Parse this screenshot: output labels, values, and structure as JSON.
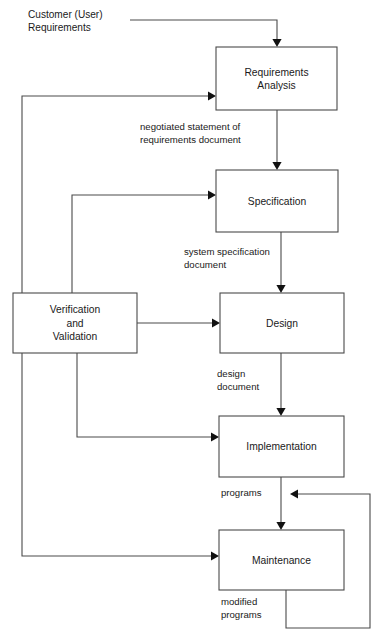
{
  "diagram": {
    "background_color": "#ffffff",
    "line_color": "#4a4a4a",
    "text_color": "#1a1a1a",
    "boxes": [
      {
        "id": "requirements-analysis",
        "lines": [
          "Requirements",
          "Analysis"
        ],
        "x": 216,
        "y": 47,
        "w": 121,
        "h": 63
      },
      {
        "id": "specification",
        "lines": [
          "Specification"
        ],
        "x": 216,
        "y": 170,
        "w": 122,
        "h": 62
      },
      {
        "id": "verification-and-validation",
        "lines": [
          "Verification",
          "and",
          "Validation"
        ],
        "x": 13,
        "y": 293,
        "w": 124,
        "h": 60
      },
      {
        "id": "design",
        "lines": [
          "Design"
        ],
        "x": 220,
        "y": 293,
        "w": 124,
        "h": 60
      },
      {
        "id": "implementation",
        "lines": [
          "Implementation"
        ],
        "x": 219,
        "y": 416,
        "w": 125,
        "h": 61
      },
      {
        "id": "maintenance",
        "lines": [
          "Maintenance"
        ],
        "x": 219,
        "y": 530,
        "w": 125,
        "h": 60
      }
    ],
    "source_label": {
      "id": "customer-user-requirements",
      "lines": [
        "Customer (User)",
        "Requirements"
      ],
      "x": 28,
      "y": 8
    },
    "edge_labels": [
      {
        "id": "negotiated-statement",
        "lines": [
          "negotiated statement of",
          "requirements document"
        ],
        "x": 140,
        "y": 120
      },
      {
        "id": "system-specification-document",
        "lines": [
          "system specification",
          "document"
        ],
        "x": 184,
        "y": 245
      },
      {
        "id": "design-document",
        "lines": [
          "design",
          "document"
        ],
        "x": 217,
        "y": 367
      },
      {
        "id": "programs",
        "lines": [
          "programs"
        ],
        "x": 221,
        "y": 486
      },
      {
        "id": "modified-programs",
        "lines": [
          "modified",
          "programs"
        ],
        "x": 221,
        "y": 595
      }
    ],
    "connectors": [
      {
        "id": "customer-to-requirements-analysis",
        "from": "Customer (User) Requirements",
        "to": "Requirements Analysis",
        "path": "M 130 20 L 277 20 L 277 43",
        "arrow": {
          "x": 277,
          "y": 47,
          "dir": "down"
        }
      },
      {
        "id": "validation-feedback-to-requirements-analysis",
        "from": "Verification and Validation",
        "to": "Requirements Analysis",
        "path": "M 22 293 L 22 96 L 212 96",
        "arrow": {
          "x": 216,
          "y": 96,
          "dir": "right"
        }
      },
      {
        "id": "requirements-analysis-to-specification",
        "from": "Requirements Analysis",
        "to": "Specification",
        "path": "M 277 110 L 277 166",
        "arrow": {
          "x": 277,
          "y": 170,
          "dir": "down"
        }
      },
      {
        "id": "validation-feedback-to-specification",
        "from": "Verification and Validation",
        "to": "Specification",
        "path": "M 72 293 L 72 195 L 212 195",
        "arrow": {
          "x": 216,
          "y": 195,
          "dir": "right"
        }
      },
      {
        "id": "specification-to-design",
        "from": "Specification",
        "to": "Design",
        "path": "M 281 232 L 281 289",
        "arrow": {
          "x": 281,
          "y": 293,
          "dir": "down"
        }
      },
      {
        "id": "validation-to-design",
        "from": "Verification and Validation",
        "to": "Design",
        "path": "M 137 323 L 216 323",
        "arrow": {
          "x": 220,
          "y": 323,
          "dir": "right"
        }
      },
      {
        "id": "design-to-implementation",
        "from": "Design",
        "to": "Implementation",
        "path": "M 281 353 L 281 412",
        "arrow": {
          "x": 281,
          "y": 416,
          "dir": "down"
        }
      },
      {
        "id": "validation-to-implementation",
        "from": "Verification and Validation",
        "to": "Implementation",
        "path": "M 77 353 L 77 437 L 215 437",
        "arrow": {
          "x": 219,
          "y": 437,
          "dir": "right"
        }
      },
      {
        "id": "implementation-to-maintenance",
        "from": "Implementation",
        "to": "Maintenance",
        "path": "M 281 477 L 281 526",
        "arrow": {
          "x": 281,
          "y": 530,
          "dir": "down"
        }
      },
      {
        "id": "validation-to-maintenance",
        "from": "Verification and Validation",
        "to": "Maintenance",
        "path": "M 22 353 L 22 556 L 215 556",
        "arrow": {
          "x": 219,
          "y": 556,
          "dir": "right"
        }
      },
      {
        "id": "maintenance-modified-programs-loop",
        "from": "Maintenance",
        "to": "programs",
        "path": "M 286 590 L 286 628 L 370 628 L 370 494 L 294 494",
        "arrow": {
          "x": 290,
          "y": 494,
          "dir": "left"
        }
      }
    ]
  }
}
